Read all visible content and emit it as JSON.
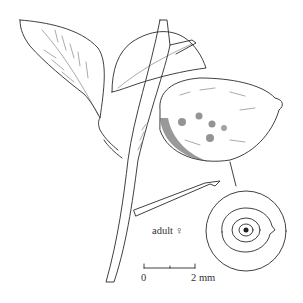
{
  "illustration": {
    "subject": "citrus branch with scale insect on fruit",
    "label": "adult ♀",
    "scale_bar": {
      "start_label": "0",
      "end_label": "2 mm"
    }
  }
}
